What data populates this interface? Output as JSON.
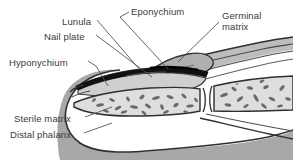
{
  "figure": {
    "background_color": "#ffffff",
    "text_color": "#3a3a3a",
    "line_color": "#4a4a4a"
  },
  "labels": [
    {
      "id": "lunula",
      "text": "Lunula",
      "x": 62,
      "y": 16
    },
    {
      "id": "eponychium",
      "text": "Eponychium",
      "x": 131,
      "y": 6
    },
    {
      "id": "germinal-matrix",
      "text": "Germinal",
      "x": 222,
      "y": 10
    },
    {
      "id": "germinal-matrix2",
      "text": "matrix",
      "x": 222,
      "y": 21
    },
    {
      "id": "nail-plate",
      "text": "Nail plate",
      "x": 44,
      "y": 31
    },
    {
      "id": "hyponychium",
      "text": "Hyponychium",
      "x": 9,
      "y": 57
    },
    {
      "id": "sterile-matrix",
      "text": "Sterile matrix",
      "x": 14,
      "y": 113
    },
    {
      "id": "distal-phalanx",
      "text": "Distal phalanx",
      "x": 10,
      "y": 129
    }
  ],
  "structures": {
    "nail_plate_color": "#111111",
    "skin_fill": "#b9b9b9",
    "pulp_fill": "#a8a8a8",
    "bone_fill": "#dedede",
    "nailbed_fill": "#cfcfcf",
    "outline": "#2f2f2f",
    "trabecular_color": "#6a6a6a"
  },
  "leaders": {
    "count": 7,
    "color": "#555555"
  }
}
